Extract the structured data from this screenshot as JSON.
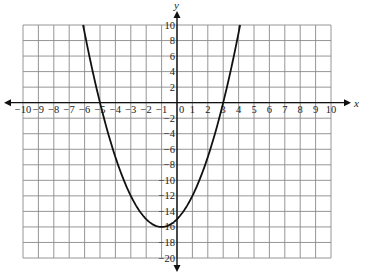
{
  "chart_data": {
    "type": "line",
    "title": "",
    "xlabel": "x",
    "ylabel": "y",
    "xlim": [
      -10,
      10
    ],
    "ylim": [
      -20,
      10
    ],
    "grid": true,
    "x_tick_step": 1,
    "y_tick_step": 2,
    "x_ticks": [
      -10,
      -9,
      -8,
      -7,
      -6,
      -5,
      -4,
      -3,
      -2,
      -1,
      0,
      1,
      2,
      3,
      4,
      5,
      6,
      7,
      8,
      9,
      10
    ],
    "x_tick_labels": [
      "−10",
      "−9",
      "−8",
      "−7",
      "−6",
      "−5",
      "−4",
      "−3",
      "−2",
      "−1",
      "0",
      "1",
      "2",
      "3",
      "4",
      "5",
      "6",
      "7",
      "8",
      "9",
      "10"
    ],
    "y_ticks": [
      10,
      8,
      6,
      4,
      2,
      -2,
      -4,
      -6,
      -8,
      -10,
      -12,
      -14,
      -16,
      -18,
      -20
    ],
    "y_tick_labels": [
      "10",
      "8",
      "6",
      "4",
      "2",
      "−2",
      "−4",
      "−6",
      "−8",
      "−10",
      "−12",
      "−14",
      "−16",
      "−18",
      "−20"
    ],
    "series": [
      {
        "name": "parabola",
        "equation": "y = x^2 + 2x - 15",
        "vertex": [
          -1,
          -16
        ],
        "x_intercepts": [
          -5,
          3
        ],
        "y_intercept": -15,
        "x": [
          -6.1,
          -6,
          -5,
          -4,
          -3,
          -2,
          -1,
          0,
          1,
          2,
          3,
          4,
          4.1
        ],
        "values": [
          10,
          9,
          0,
          -7,
          -12,
          -15,
          -16,
          -15,
          -12,
          -7,
          0,
          9,
          10
        ]
      }
    ]
  },
  "colors": {
    "grid": "#8a8a8a",
    "axis": "#111111",
    "curve": "#111111",
    "background": "#ffffff"
  }
}
